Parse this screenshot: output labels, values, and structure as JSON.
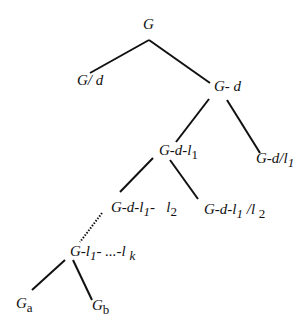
{
  "diagram": {
    "type": "tree",
    "nodes": {
      "root": {
        "label": "G"
      },
      "g_div_d": {
        "label": "G/ d"
      },
      "g_minus_d": {
        "label": "G- d"
      },
      "g_d_l1": {
        "main": "G-d-l",
        "sub": "1"
      },
      "g_d_div_l1": {
        "main": "G-d/l",
        "sub": "1"
      },
      "g_d_l1_l2": {
        "main": "G-d-l",
        "sub": "1",
        "mid": "-   l",
        "sub2": "2"
      },
      "g_d_l1_div_l2": {
        "main": "G-d-l",
        "sub": "1",
        "mid": " /l ",
        "sub2": "2"
      },
      "g_l1_lk": {
        "main": "G-l",
        "sub": "1",
        "mid": "- ...-l ",
        "sub2": "k"
      },
      "ga": {
        "main": "G",
        "sub": "a"
      },
      "gb": {
        "main": "G",
        "sub": "b"
      }
    },
    "edges": [
      {
        "from": "root",
        "to": "g_div_d",
        "style": "solid"
      },
      {
        "from": "root",
        "to": "g_minus_d",
        "style": "solid"
      },
      {
        "from": "g_minus_d",
        "to": "g_d_l1",
        "style": "solid"
      },
      {
        "from": "g_minus_d",
        "to": "g_d_div_l1",
        "style": "solid"
      },
      {
        "from": "g_d_l1",
        "to": "g_d_l1_l2",
        "style": "solid"
      },
      {
        "from": "g_d_l1",
        "to": "g_d_l1_div_l2",
        "style": "solid"
      },
      {
        "from": "g_d_l1_l2",
        "to": "g_l1_lk",
        "style": "dotted"
      },
      {
        "from": "g_l1_lk",
        "to": "ga",
        "style": "solid"
      },
      {
        "from": "g_l1_lk",
        "to": "gb",
        "style": "solid"
      }
    ],
    "edge_color": "#111111"
  }
}
